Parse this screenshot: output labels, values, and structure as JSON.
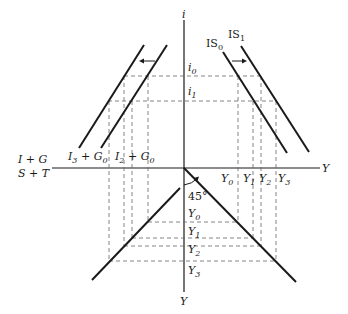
{
  "diagram": {
    "axes": {
      "vertical_top_label": "i",
      "vertical_bottom_label": "Y",
      "horizontal_right_label": "Y",
      "horizontal_left_label_top": "I + G",
      "horizontal_left_label_bottom": "S + T"
    },
    "interest_rates": {
      "i0": {
        "base": "i",
        "sub": "0"
      },
      "i1": {
        "base": "i",
        "sub": "1"
      }
    },
    "is_curves": {
      "is0": {
        "base": "IS",
        "sub": "0"
      },
      "is1": {
        "base": "IS",
        "sub": "1"
      }
    },
    "spending_curves": {
      "left": {
        "text": "I",
        "sub1": "3",
        "mid": " + G",
        "sub2": "0"
      },
      "right": {
        "text": "I",
        "sub1": "2",
        "mid": " + G",
        "sub2": "0"
      }
    },
    "income_levels_horizontal": [
      {
        "base": "Y",
        "sub": "0"
      },
      {
        "base": "Y",
        "sub": "1"
      },
      {
        "base": "Y",
        "sub": "2"
      },
      {
        "base": "Y",
        "sub": "3"
      }
    ],
    "income_levels_vertical": [
      {
        "base": "Y",
        "sub": "0"
      },
      {
        "base": "Y",
        "sub": "1"
      },
      {
        "base": "Y",
        "sub": "2"
      },
      {
        "base": "Y",
        "sub": "3"
      }
    ],
    "angle_label": "45°",
    "colors": {
      "ink": "#1a1a1a",
      "guide": "#666666",
      "background": "#ffffff"
    }
  }
}
